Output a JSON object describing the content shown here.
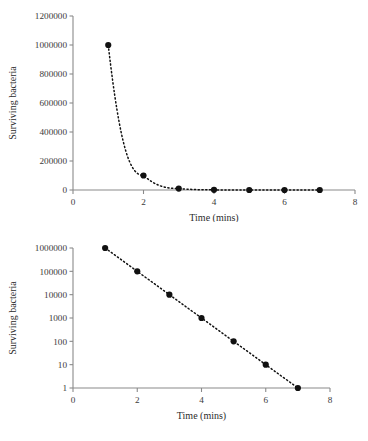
{
  "page": {
    "background_color": "#ffffff",
    "ink_color": "#111111",
    "axis_color": "#8a8a8a"
  },
  "chart_data": [
    {
      "id": "linear-decay-chart",
      "type": "scatter",
      "title": "",
      "xlabel": "Time (mins)",
      "ylabel": "Surviving bacteria",
      "xlim": [
        0,
        8
      ],
      "ylim": [
        0,
        1200000
      ],
      "yscale": "linear",
      "xscale": "linear",
      "grid": false,
      "legend": "none",
      "xticks": [
        0,
        2,
        4,
        6,
        8
      ],
      "xticklabels": [
        "0",
        "2",
        "4",
        "6",
        "8"
      ],
      "yticks": [
        0,
        200000,
        400000,
        600000,
        800000,
        1000000,
        1200000
      ],
      "yticklabels": [
        "0",
        "200000",
        "400000",
        "600000",
        "800000",
        "1000000",
        "1200000"
      ],
      "x": [
        1,
        2,
        3,
        4,
        5,
        6,
        7
      ],
      "values": [
        1000000,
        100000,
        10000,
        1000,
        100,
        10,
        1
      ],
      "marker": "filled-circle",
      "linestyle": "dotted",
      "series_name": "Surviving bacteria"
    },
    {
      "id": "log-decay-chart",
      "type": "scatter",
      "title": "",
      "xlabel": "Time (mins)",
      "ylabel": "Surviving bacteria",
      "xlim": [
        0,
        8
      ],
      "ylim": [
        1,
        1000000
      ],
      "yscale": "log",
      "xscale": "linear",
      "grid": false,
      "legend": "none",
      "xticks": [
        0,
        2,
        4,
        6,
        8
      ],
      "xticklabels": [
        "0",
        "2",
        "4",
        "6",
        "8"
      ],
      "yticks": [
        1,
        10,
        100,
        1000,
        10000,
        100000,
        1000000
      ],
      "yticklabels": [
        "1",
        "10",
        "100",
        "1000",
        "10000",
        "100000",
        "1000000"
      ],
      "x": [
        1,
        2,
        3,
        4,
        5,
        6,
        7
      ],
      "values": [
        1000000,
        100000,
        10000,
        1000,
        100,
        10,
        1
      ],
      "marker": "filled-circle",
      "linestyle": "dotted",
      "series_name": "Surviving bacteria"
    }
  ]
}
